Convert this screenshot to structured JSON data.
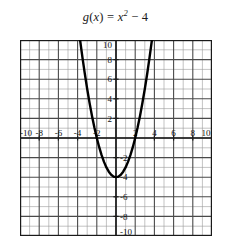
{
  "title": {
    "full": "g(x) = x² − 4",
    "func_name": "g",
    "lparen": "(",
    "variable": "x",
    "rparen": ")",
    "equals": "=",
    "base": "x",
    "exponent": "2",
    "minus": "−",
    "constant": "4"
  },
  "colors": {
    "curve": "#000000",
    "axis": "#1a1a1a",
    "major_grid": "#4a4a4a",
    "minor_grid": "#9a9a9a",
    "background": "#ffffff",
    "text": "#111111"
  },
  "axes": {
    "x_label_values": [
      "-10",
      "-8",
      "-6",
      "-4",
      "-2",
      "2",
      "4",
      "6",
      "8",
      "10"
    ],
    "y_label_values": [
      "10",
      "8",
      "6",
      "4",
      "2",
      "-2",
      "-4",
      "-6",
      "-8",
      "-10"
    ]
  },
  "chart_data": {
    "type": "line",
    "xlabel": "",
    "ylabel": "",
    "xlim": [
      -10,
      10
    ],
    "ylim": [
      -10,
      10
    ],
    "xticks": [
      -10,
      -8,
      -6,
      -4,
      -2,
      2,
      4,
      6,
      8,
      10
    ],
    "yticks": [
      10,
      8,
      6,
      4,
      2,
      -2,
      -4,
      -6,
      -8,
      -10
    ],
    "grid": true,
    "minor_grid_step": 1,
    "major_grid_step": 2,
    "legend": null,
    "equation": "y = x^2 - 4",
    "vertex": [
      0,
      -4
    ],
    "x_intercepts": [
      -2,
      2
    ],
    "y_intercept": -4,
    "domain_drawn": [
      -3.742,
      3.742
    ],
    "series": [
      {
        "name": "g(x) = x² − 4",
        "x": [
          -3.742,
          -3.5,
          -3.25,
          -3.0,
          -2.75,
          -2.5,
          -2.25,
          -2.0,
          -1.75,
          -1.5,
          -1.25,
          -1.0,
          -0.75,
          -0.5,
          -0.25,
          0,
          0.25,
          0.5,
          0.75,
          1.0,
          1.25,
          1.5,
          1.75,
          2.0,
          2.25,
          2.5,
          2.75,
          3.0,
          3.25,
          3.5,
          3.742
        ],
        "y": [
          10.0,
          8.25,
          6.5625,
          5.0,
          3.5625,
          2.25,
          1.0625,
          0,
          -0.9375,
          -1.75,
          -2.4375,
          -3.0,
          -3.4375,
          -3.75,
          -3.9375,
          -4.0,
          -3.9375,
          -3.75,
          -3.4375,
          -3.0,
          -2.4375,
          -1.75,
          -0.9375,
          0,
          1.0625,
          2.25,
          3.5625,
          5.0,
          6.5625,
          8.25,
          10.0
        ]
      }
    ]
  }
}
